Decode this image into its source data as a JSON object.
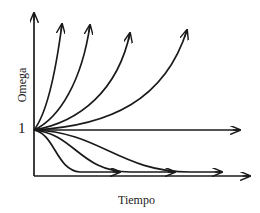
{
  "diagram": {
    "y_axis_label": "Omega",
    "x_axis_label": "Tiempo",
    "origin_value_label": "1",
    "colors": {
      "stroke": "#1a1a1a",
      "background": "#ffffff"
    },
    "curves": {
      "growing": 5,
      "constant": 1,
      "decaying": 3
    }
  }
}
